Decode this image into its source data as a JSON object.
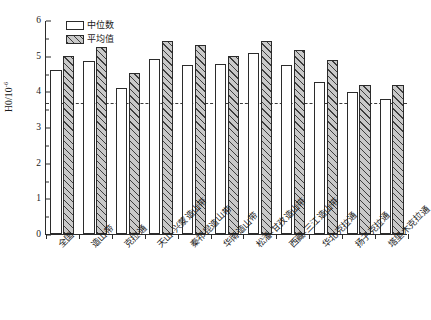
{
  "chart_data": {
    "type": "bar",
    "title": "",
    "xlabel": "",
    "ylabel": "H0/10",
    "ylabel_exponent": "-6",
    "ylim": [
      0,
      6
    ],
    "yticks": [
      0,
      1,
      2,
      3,
      4,
      5,
      6
    ],
    "ytick_labels": [
      "0",
      "1",
      "2",
      "3",
      "4",
      "5",
      "6"
    ],
    "minor_ticks_per_interval": 1,
    "grid": false,
    "legend_position": "top-left-inside",
    "categories": [
      "全国",
      "造山带",
      "克拉通",
      "天山-兴蒙造山带",
      "秦祁昆造山带",
      "华南造山带",
      "松潘-甘孜造山带",
      "西藏-三江造山带",
      "华北克拉通",
      "扬子克拉通",
      "塔里木克拉通"
    ],
    "series": [
      {
        "name": "中位数",
        "style": "open-white",
        "values": [
          4.6,
          4.85,
          4.08,
          4.91,
          4.73,
          4.78,
          5.08,
          4.73,
          4.25,
          3.98,
          3.79
        ]
      },
      {
        "name": "平均值",
        "style": "gray-hatched",
        "values": [
          4.98,
          5.25,
          4.51,
          5.42,
          5.31,
          5.0,
          5.4,
          5.17,
          4.87,
          4.17,
          4.17
        ]
      }
    ],
    "reference_line": {
      "value": 3.69,
      "style": "dashed",
      "orientation": "horizontal"
    },
    "colors": {
      "axis": "#2b2b2b",
      "median_fill": "#ffffff",
      "mean_fill": "#c9c9c9",
      "hatch": "#3d3d3d",
      "reference_line": "#3a3a3a"
    }
  },
  "legend": {
    "items": [
      {
        "label": "中位数"
      },
      {
        "label": "平均值"
      }
    ]
  },
  "caption": {
    "text": ""
  }
}
